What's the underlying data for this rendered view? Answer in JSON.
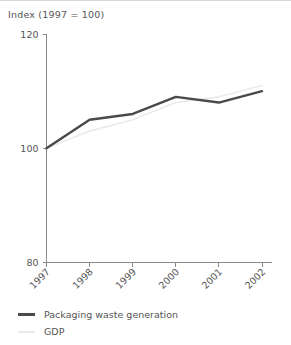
{
  "chart_data": {
    "type": "line",
    "title": "Index (1997 = 100)",
    "xlabel": "",
    "ylabel": "",
    "categories": [
      "1997",
      "1998",
      "1999",
      "2000",
      "2001",
      "2002"
    ],
    "series": [
      {
        "name": "Packaging waste generation",
        "color": "#4a4a4a",
        "values": [
          100,
          105,
          106,
          109,
          108,
          110
        ]
      },
      {
        "name": "GDP",
        "color": "#ebebeb",
        "values": [
          100,
          103,
          105,
          108,
          109,
          111
        ]
      }
    ],
    "ylim": [
      80,
      120
    ],
    "yticks": [
      80,
      100,
      120
    ],
    "ytick_labels": [
      "80",
      "100",
      "120"
    ],
    "grid": false,
    "legend_position": "bottom-left",
    "xtick_rotation": 45
  },
  "legend": {
    "items": [
      {
        "label": "Packaging waste generation",
        "color": "#4a4a4a",
        "weight": "3px"
      },
      {
        "label": "GDP",
        "color": "#ebebeb",
        "weight": "2px"
      }
    ]
  }
}
